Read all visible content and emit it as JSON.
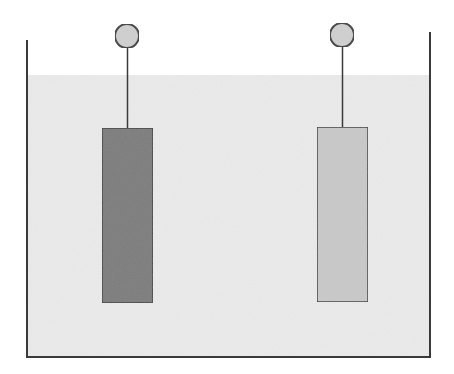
{
  "diagram": {
    "title": "",
    "type": "electrochemical cell (two electrodes in electrolyte)",
    "colors": {
      "background": "#ffffff",
      "outline": "#3a3a3a",
      "electrolyte": "#ebebeb",
      "electrode_left": "#7c7c7c",
      "electrode_right": "#c9c9c9",
      "terminal": "#d0d0d0"
    },
    "beaker": {
      "left_wall": {
        "x": 27,
        "y_top": 40,
        "y_bottom": 357
      },
      "right_wall": {
        "x": 430,
        "y_top": 32,
        "y_bottom": 357
      },
      "bottom_y": 357
    },
    "electrolyte": {
      "surface_y": 75
    },
    "electrodes": [
      {
        "id": "left",
        "shade": "dark",
        "x": 102,
        "y": 128,
        "width": 51,
        "height": 175,
        "terminal": {
          "cx": 127,
          "cy": 36,
          "r": 12
        }
      },
      {
        "id": "right",
        "shade": "light",
        "x": 317,
        "y": 127,
        "width": 51,
        "height": 175,
        "terminal": {
          "cx": 342,
          "cy": 35,
          "r": 12
        }
      }
    ]
  }
}
